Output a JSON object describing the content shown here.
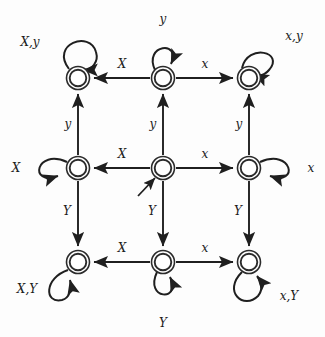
{
  "diagram": {
    "type": "finite-state-automaton",
    "title": "",
    "canvas": {
      "width": 325,
      "height": 337
    },
    "node_style": {
      "shape": "double-circle",
      "radius_outer": 11,
      "radius_inner": 8
    },
    "stroke_color": "#1f1f1f",
    "background_color": "#fdfdfd",
    "start_state": "center",
    "states": [
      {
        "id": "top-left",
        "cx": 78,
        "cy": 78,
        "accepting": true,
        "self_loop_label": "X,y",
        "loop_position": "upper-left"
      },
      {
        "id": "top-center",
        "cx": 163,
        "cy": 78,
        "accepting": true,
        "self_loop_label": "y",
        "loop_position": "top"
      },
      {
        "id": "top-right",
        "cx": 249,
        "cy": 78,
        "accepting": true,
        "self_loop_label": "x,y",
        "loop_position": "upper-right"
      },
      {
        "id": "middle-left",
        "cx": 78,
        "cy": 168,
        "accepting": true,
        "self_loop_label": "X",
        "loop_position": "left"
      },
      {
        "id": "center",
        "cx": 163,
        "cy": 168,
        "accepting": true,
        "self_loop_label": "",
        "loop_position": "none"
      },
      {
        "id": "middle-right",
        "cx": 249,
        "cy": 168,
        "accepting": true,
        "self_loop_label": "x",
        "loop_position": "right"
      },
      {
        "id": "bottom-left",
        "cx": 78,
        "cy": 262,
        "accepting": true,
        "self_loop_label": "X,Y",
        "loop_position": "lower-left"
      },
      {
        "id": "bottom-center",
        "cx": 163,
        "cy": 262,
        "accepting": true,
        "self_loop_label": "Y",
        "loop_position": "bottom"
      },
      {
        "id": "bottom-right",
        "cx": 249,
        "cy": 262,
        "accepting": true,
        "self_loop_label": "x,Y",
        "loop_position": "lower-right"
      }
    ],
    "transitions": [
      {
        "from": "top-center",
        "to": "top-left",
        "label": "X",
        "direction": "left"
      },
      {
        "from": "top-center",
        "to": "top-right",
        "label": "x",
        "direction": "right"
      },
      {
        "from": "center",
        "to": "middle-left",
        "label": "X",
        "direction": "left"
      },
      {
        "from": "center",
        "to": "middle-right",
        "label": "x",
        "direction": "right"
      },
      {
        "from": "bottom-center",
        "to": "bottom-left",
        "label": "X",
        "direction": "left"
      },
      {
        "from": "bottom-center",
        "to": "bottom-right",
        "label": "x",
        "direction": "right"
      },
      {
        "from": "middle-left",
        "to": "top-left",
        "label": "y",
        "direction": "up"
      },
      {
        "from": "center",
        "to": "top-center",
        "label": "y",
        "direction": "up"
      },
      {
        "from": "middle-right",
        "to": "top-right",
        "label": "y",
        "direction": "up"
      },
      {
        "from": "middle-left",
        "to": "bottom-left",
        "label": "Y",
        "direction": "down"
      },
      {
        "from": "center",
        "to": "bottom-center",
        "label": "Y",
        "direction": "down"
      },
      {
        "from": "middle-right",
        "to": "bottom-right",
        "label": "Y",
        "direction": "down"
      }
    ],
    "labels": {
      "loop_top_left": "X,y",
      "loop_top_center": "y",
      "loop_top_right": "x,y",
      "loop_middle_left": "X",
      "loop_middle_right": "x",
      "loop_bottom_left": "X,Y",
      "loop_bottom_center": "Y",
      "loop_bottom_right": "x,Y",
      "edge_top_left": "X",
      "edge_top_right": "x",
      "edge_mid_left": "X",
      "edge_mid_right": "x",
      "edge_bot_left": "X",
      "edge_bot_right": "x",
      "edge_col_left_up": "y",
      "edge_col_center_up": "y",
      "edge_col_right_up": "y",
      "edge_col_left_down": "Y",
      "edge_col_center_down": "Y",
      "edge_col_right_down": "Y"
    }
  }
}
